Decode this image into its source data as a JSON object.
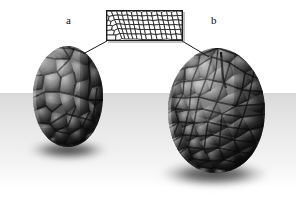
{
  "figure": {
    "background_color": "#ffffff",
    "ground_color": "#e4e4e4",
    "width": 296,
    "height": 199
  },
  "labels": {
    "left": "a",
    "right": "b"
  },
  "inset": {
    "name": "cellular-texture-swatch",
    "description": "2D Voronoi / cellular noise pattern used as the displacement map",
    "border_color": "#1b1b1b",
    "cell_fill": "#ffffff",
    "cell_edge": "#202020",
    "x": 106,
    "y": 10,
    "width": 77,
    "height": 31,
    "cell_count": 210
  },
  "objects": [
    {
      "id": "egg-a",
      "label": "a",
      "name": "egg-low-frequency",
      "description": "Egg with coarse, large-scale cellular displacement",
      "center_x": 68,
      "center_y": 97,
      "width": 70,
      "height": 101,
      "cell_scale": "coarse",
      "cell_count": 55,
      "body_color": "#4a4a4a",
      "highlight_color": "#b8b8b8",
      "shadow_color": "#141414"
    },
    {
      "id": "egg-b",
      "label": "b",
      "name": "egg-high-frequency",
      "description": "Egg with fine, dense cellular displacement",
      "center_x": 216,
      "center_y": 111,
      "width": 97,
      "height": 125,
      "cell_scale": "fine",
      "cell_count": 150,
      "body_color": "#4a4a4a",
      "highlight_color": "#bdbdbd",
      "shadow_color": "#121212"
    }
  ],
  "leader_lines": [
    {
      "name": "leader-line-left",
      "from_x": 107,
      "from_y": 41,
      "to_x": 83,
      "to_y": 54
    },
    {
      "name": "leader-line-right",
      "from_x": 182,
      "from_y": 41,
      "to_x": 209,
      "to_y": 57
    }
  ],
  "shadows": [
    {
      "name": "shadow-egg-a",
      "cx": 68,
      "cy": 150,
      "rx": 40,
      "ry": 10
    },
    {
      "name": "shadow-egg-b",
      "cx": 214,
      "cy": 174,
      "rx": 55,
      "ry": 13
    }
  ]
}
